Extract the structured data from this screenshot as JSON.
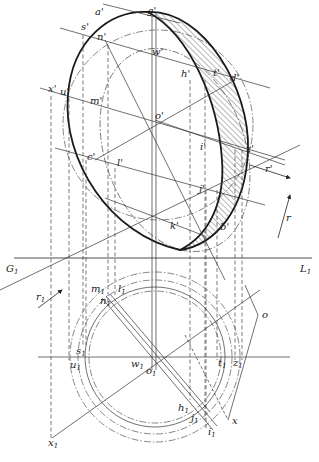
{
  "figure": {
    "type": "descriptive-geometry construction",
    "ground_line": {
      "left": "G",
      "left_sub": "1",
      "right": "L",
      "right_sub": "1"
    },
    "upper_view_labels": [
      {
        "id": "a",
        "text": "a'",
        "x": 95,
        "y": 15
      },
      {
        "id": "g",
        "text": "g'",
        "x": 147,
        "y": 14
      },
      {
        "id": "s",
        "text": "s'",
        "x": 81,
        "y": 30
      },
      {
        "id": "n",
        "text": "n'",
        "x": 97,
        "y": 40
      },
      {
        "id": "w",
        "text": "w'",
        "x": 152,
        "y": 55
      },
      {
        "id": "h",
        "text": "h'",
        "x": 181,
        "y": 77
      },
      {
        "id": "t",
        "text": "t'",
        "x": 213,
        "y": 76
      },
      {
        "id": "d",
        "text": "d'",
        "x": 230,
        "y": 81
      },
      {
        "id": "x",
        "text": "x'",
        "x": 48,
        "y": 92
      },
      {
        "id": "u",
        "text": "u'",
        "x": 60,
        "y": 95
      },
      {
        "id": "m",
        "text": "m'",
        "x": 90,
        "y": 104
      },
      {
        "id": "o",
        "text": "o'",
        "x": 155,
        "y": 119
      },
      {
        "id": "i",
        "text": "i'",
        "x": 200,
        "y": 150
      },
      {
        "id": "z",
        "text": "z'",
        "x": 246,
        "y": 152
      },
      {
        "id": "c",
        "text": "c'",
        "x": 87,
        "y": 160
      },
      {
        "id": "l",
        "text": "l'",
        "x": 117,
        "y": 166
      },
      {
        "id": "r_prime",
        "text": "r'",
        "x": 265,
        "y": 172
      },
      {
        "id": "j",
        "text": "j'",
        "x": 199,
        "y": 192
      },
      {
        "id": "k",
        "text": "k'",
        "x": 170,
        "y": 229
      },
      {
        "id": "b",
        "text": "b'",
        "x": 220,
        "y": 230
      },
      {
        "id": "r",
        "text": "r",
        "x": 286,
        "y": 221
      }
    ],
    "lower_view_labels": [
      {
        "id": "r1",
        "text": "r",
        "sub": "1",
        "x": 36,
        "y": 300
      },
      {
        "id": "m1",
        "text": "m",
        "sub": "1",
        "x": 91,
        "y": 292
      },
      {
        "id": "l1",
        "text": "l",
        "sub": "1",
        "x": 118,
        "y": 292
      },
      {
        "id": "n1",
        "text": "n",
        "sub": "1",
        "x": 100,
        "y": 304
      },
      {
        "id": "o_plan",
        "text": "o",
        "x": 262,
        "y": 318
      },
      {
        "id": "s1",
        "text": "s",
        "sub": "1",
        "x": 76,
        "y": 354
      },
      {
        "id": "u1",
        "text": "u",
        "sub": "1",
        "x": 70,
        "y": 366
      },
      {
        "id": "w1",
        "text": "w",
        "sub": "1",
        "x": 131,
        "y": 365
      },
      {
        "id": "o1",
        "text": "o",
        "sub": "1",
        "x": 146,
        "y": 373
      },
      {
        "id": "t1",
        "text": "t",
        "sub": "1",
        "x": 218,
        "y": 365
      },
      {
        "id": "z1",
        "text": "z",
        "sub": "1",
        "x": 233,
        "y": 365
      },
      {
        "id": "h1",
        "text": "h",
        "sub": "1",
        "x": 180,
        "y": 410
      },
      {
        "id": "j1",
        "text": "j",
        "sub": "1",
        "x": 192,
        "y": 420
      },
      {
        "id": "x_plan",
        "text": "x",
        "x": 233,
        "y": 423
      },
      {
        "id": "i1",
        "text": "i",
        "sub": "1",
        "x": 209,
        "y": 434
      },
      {
        "id": "x1",
        "text": "x",
        "sub": "1",
        "x": 49,
        "y": 442
      }
    ]
  }
}
